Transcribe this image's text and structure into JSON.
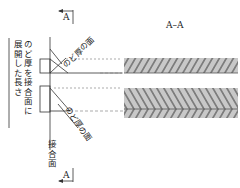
{
  "diagram": {
    "section_label": "A–A",
    "section_marker_top": "A",
    "section_marker_bottom": "A",
    "throat_face_label_upper": "のど厚の面",
    "throat_face_label_lower": "のど厚の面",
    "joint_face_label": "接合面",
    "expanded_length_label_line1": "のど厚を接合面に",
    "expanded_length_label_line2": "展開した長さ",
    "colors": {
      "line": "#333333",
      "dashed": "#888888",
      "hatch_fill": "#c8c8c8",
      "hatch_line": "#333333"
    }
  }
}
